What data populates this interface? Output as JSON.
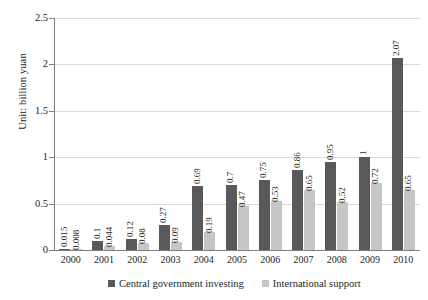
{
  "chart_data": {
    "type": "bar",
    "title": "",
    "xlabel": "",
    "ylabel": "Unit: billion yuan",
    "ylim": [
      0,
      2.5
    ],
    "yticks": [
      "0",
      "0.5",
      "1",
      "1.5",
      "2",
      "2.5"
    ],
    "grid": true,
    "legend_position": "bottom",
    "categories": [
      "2000",
      "2001",
      "2002",
      "2003",
      "2004",
      "2005",
      "2006",
      "2007",
      "2008",
      "2009",
      "2010"
    ],
    "series": [
      {
        "name": "Central government investing",
        "color": "#59595b",
        "values": [
          0.015,
          0.1,
          0.12,
          0.27,
          0.69,
          0.7,
          0.75,
          0.86,
          0.95,
          1,
          2.07
        ],
        "labels": [
          "0.015",
          "0.1",
          "0.12",
          "0.27",
          "0.69",
          "0.7",
          "0.75",
          "0.86",
          "0.95",
          "1",
          "2.07"
        ]
      },
      {
        "name": "International support",
        "color": "#c6c6c6",
        "values": [
          0.008,
          0.044,
          0.08,
          0.09,
          0.19,
          0.47,
          0.53,
          0.65,
          0.52,
          0.72,
          0.65
        ],
        "labels": [
          "0.008",
          "0.044",
          "0.08",
          "0.09",
          "0.19",
          "0.47",
          "0.53",
          "0.65",
          "0.52",
          "0.72",
          "0.65"
        ]
      }
    ]
  }
}
